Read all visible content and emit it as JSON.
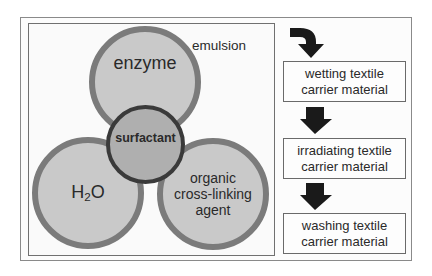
{
  "diagram": {
    "composition": {
      "container_label": "emulsion",
      "components": [
        {
          "id": "enzyme",
          "label": "enzyme"
        },
        {
          "id": "water",
          "label_main": "H",
          "label_sub": "2",
          "label_tail": "O"
        },
        {
          "id": "organic",
          "lines": [
            "organic",
            "cross-linking",
            "agent"
          ]
        }
      ],
      "center": {
        "id": "surfactant",
        "label": "surfactant"
      }
    },
    "process": {
      "steps": [
        {
          "lines": [
            "wetting textile",
            "carrier material"
          ]
        },
        {
          "lines": [
            "irradiating textile",
            "carrier material"
          ]
        },
        {
          "lines": [
            "washing textile",
            "carrier material"
          ]
        }
      ],
      "arrow_icons": [
        "curved-arrow-down-icon",
        "arrow-down-icon",
        "arrow-down-icon"
      ]
    },
    "colors": {
      "circle_fill": "#c9c9c9",
      "circle_ring": "#7b7b7b",
      "surfactant_fill": "#afafaf",
      "surfactant_ring": "#3a3a3a",
      "arrow": "#1a1a1a"
    }
  }
}
